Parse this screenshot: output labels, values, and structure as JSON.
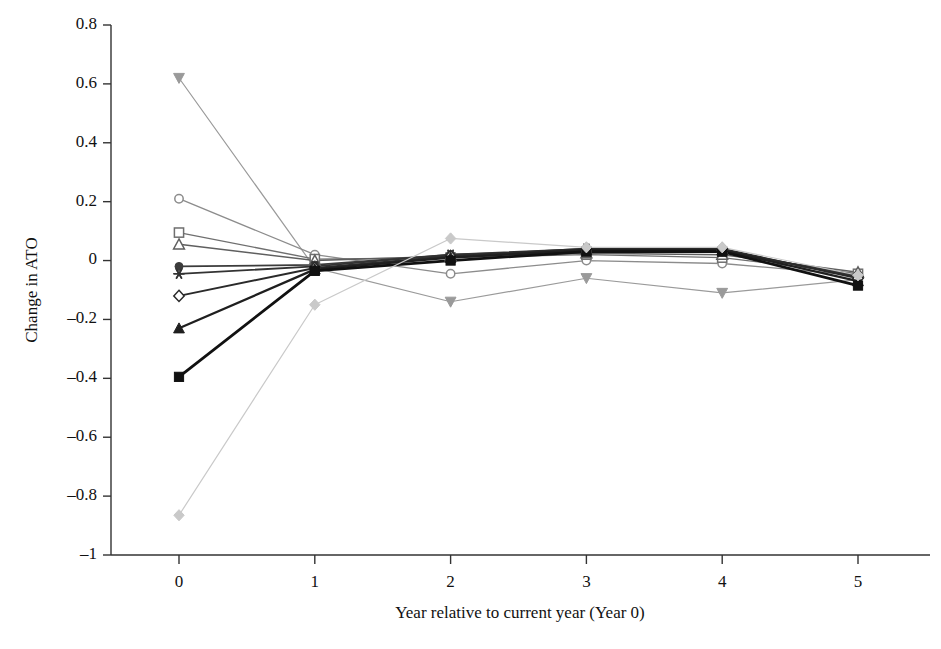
{
  "chart_data": {
    "type": "line",
    "title": "",
    "subtitle": "",
    "xlabel": "Year relative to current year (Year 0)",
    "ylabel": "Change in ATO",
    "x": [
      0,
      1,
      2,
      3,
      4,
      5
    ],
    "xticklabels": [
      "0",
      "1",
      "2",
      "3",
      "4",
      "5"
    ],
    "yticklabels": [
      "0.8",
      "0.6",
      "0.4",
      "0.2",
      "0",
      "–0.2",
      "–0.4",
      "–0.6",
      "–0.8",
      "–1"
    ],
    "yticks": [
      0.8,
      0.6,
      0.4,
      0.2,
      0,
      -0.2,
      -0.4,
      -0.6,
      -0.8,
      -1
    ],
    "xlim": [
      -0.35,
      5.25
    ],
    "ylim": [
      -1,
      0.8
    ],
    "grid": false,
    "legend": "none",
    "series": [
      {
        "name": "Decile 1 (highest prior ATO)",
        "marker": "triangle-down-filled",
        "color": "#9a9a9a",
        "linewidth": 1.2,
        "values": [
          0.62,
          -0.025,
          -0.14,
          -0.06,
          -0.11,
          -0.065
        ]
      },
      {
        "name": "Decile 2",
        "marker": "circle-open",
        "color": "#8c8c8c",
        "linewidth": 1.3,
        "values": [
          0.21,
          0.02,
          -0.045,
          0.0,
          -0.01,
          -0.05
        ]
      },
      {
        "name": "Decile 3",
        "marker": "square-open",
        "color": "#6f6f6f",
        "linewidth": 1.4,
        "values": [
          0.095,
          0.005,
          0.01,
          0.02,
          0.01,
          -0.045
        ]
      },
      {
        "name": "Decile 4",
        "marker": "triangle-up-open",
        "color": "#5f5f5f",
        "linewidth": 1.5,
        "values": [
          0.055,
          0.0,
          0.015,
          0.025,
          0.02,
          -0.04
        ]
      },
      {
        "name": "Decile 5",
        "marker": "circle-filled",
        "color": "#3c3c3c",
        "linewidth": 1.7,
        "values": [
          -0.02,
          -0.015,
          0.02,
          0.035,
          0.03,
          -0.05
        ]
      },
      {
        "name": "Decile 6",
        "marker": "asterisk",
        "color": "#333333",
        "linewidth": 1.8,
        "values": [
          -0.045,
          -0.02,
          0.02,
          0.04,
          0.035,
          -0.055
        ]
      },
      {
        "name": "Decile 7",
        "marker": "diamond-open",
        "color": "#2a2a2a",
        "linewidth": 2.0,
        "values": [
          -0.12,
          -0.025,
          0.015,
          0.04,
          0.04,
          -0.06
        ]
      },
      {
        "name": "Decile 8",
        "marker": "triangle-up-filled",
        "color": "#1f1f1f",
        "linewidth": 2.3,
        "values": [
          -0.23,
          -0.03,
          0.01,
          0.035,
          0.035,
          -0.07
        ]
      },
      {
        "name": "Decile 9",
        "marker": "square-filled",
        "color": "#111111",
        "linewidth": 2.8,
        "values": [
          -0.395,
          -0.035,
          0.0,
          0.03,
          0.03,
          -0.085
        ]
      },
      {
        "name": "Decile 10 (lowest prior ATO)",
        "marker": "diamond-filled",
        "color": "#c9c9c9",
        "linewidth": 1.2,
        "values": [
          -0.865,
          -0.15,
          0.075,
          0.045,
          0.045,
          -0.05
        ]
      }
    ]
  },
  "axes": {
    "y_axis_label": "Change in ATO",
    "x_axis_label": "Year relative to current year (Year 0)"
  }
}
